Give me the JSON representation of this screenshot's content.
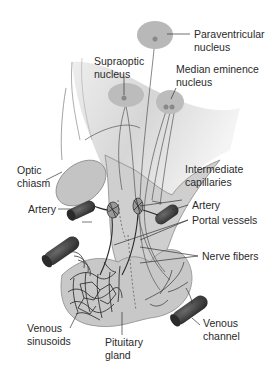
{
  "diagram": {
    "type": "anatomical-illustration",
    "colors": {
      "tissue": "#c9c9c9",
      "tissue_light": "#dedede",
      "nucleus": "#b5b5b5",
      "vessel": "#3a3a3a",
      "line": "#333333",
      "text": "#2a2a2a"
    },
    "labels": {
      "paraventricular": {
        "line1": "Paraventricular",
        "line2": "nucleus"
      },
      "supraoptic": {
        "line1": "Supraoptic",
        "line2": "nucleus"
      },
      "median_eminence": {
        "line1": "Median eminence",
        "line2": "nucleus"
      },
      "optic_chiasm": {
        "line1": "Optic",
        "line2": "chiasm"
      },
      "intermediate_capillaries": {
        "line1": "Intermediate",
        "line2": "capillaries"
      },
      "artery_left": {
        "line1": "Artery"
      },
      "artery_right": {
        "line1": "Artery"
      },
      "portal_vessels": {
        "line1": "Portal vessels"
      },
      "nerve_fibers": {
        "line1": "Nerve fibers"
      },
      "venous_sinusoids": {
        "line1": "Venous",
        "line2": "sinusoids"
      },
      "pituitary_gland": {
        "line1": "Pituitary",
        "line2": "gland"
      },
      "venous_channel": {
        "line1": "Venous",
        "line2": "channel"
      }
    }
  }
}
